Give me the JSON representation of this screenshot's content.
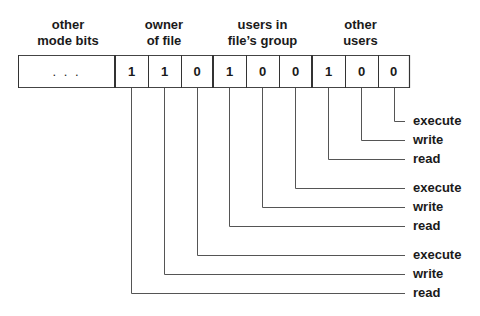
{
  "diagram": {
    "headers": [
      {
        "id": "other-mode-bits",
        "line1": "other",
        "line2": "mode bits"
      },
      {
        "id": "owner",
        "line1": "owner",
        "line2": "of file"
      },
      {
        "id": "group",
        "line1": "users in",
        "line2": "file’s group"
      },
      {
        "id": "others",
        "line1": "other",
        "line2": "users"
      }
    ],
    "ellipsis": ". . .",
    "bits": [
      "1",
      "1",
      "0",
      "1",
      "0",
      "0",
      "1",
      "0",
      "0"
    ],
    "labels": [
      "execute",
      "write",
      "read",
      "execute",
      "write",
      "read",
      "execute",
      "write",
      "read"
    ]
  }
}
